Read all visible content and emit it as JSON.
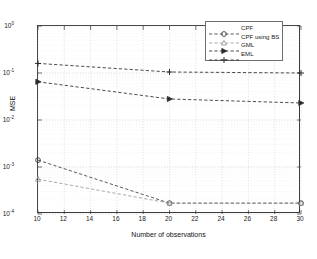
{
  "chart_data": {
    "type": "line",
    "title": "",
    "xlabel": "Number of observations",
    "ylabel": "MSE",
    "xlim": [
      10,
      30
    ],
    "ylim": [
      0.0001,
      1
    ],
    "yscale": "log",
    "grid": true,
    "legend_position": "top-right",
    "xticks": [
      "10",
      "12",
      "14",
      "16",
      "18",
      "20",
      "22",
      "24",
      "26",
      "28",
      "30"
    ],
    "xtick_values": [
      10,
      12,
      14,
      16,
      18,
      20,
      22,
      24,
      26,
      28,
      30
    ],
    "yticks": [
      "10^0",
      "10^-1",
      "10^-2",
      "10^-3",
      "10^-4"
    ],
    "ytick_exponents": [
      "0",
      "-1",
      "-2",
      "-3",
      "-4"
    ],
    "ytick_values": [
      1,
      0.1,
      0.01,
      0.001,
      0.0001
    ],
    "x": [
      10,
      20,
      30
    ],
    "series": [
      {
        "name": "CPF",
        "marker": "circle",
        "linestyle": "dashed",
        "color": "#3c3c3c",
        "values": [
          0.0014,
          0.00017,
          0.00017
        ]
      },
      {
        "name": "CPF using BS",
        "marker": "triangle-up",
        "linestyle": "dashed",
        "color": "#9a9a9a",
        "values": [
          0.00055,
          0.00017,
          0.00017
        ]
      },
      {
        "name": "GML",
        "marker": "triangle-right",
        "linestyle": "dashed",
        "color": "#2b2b2b",
        "values": [
          0.065,
          0.028,
          0.023
        ]
      },
      {
        "name": "EML",
        "marker": "plus",
        "linestyle": "dashed",
        "color": "#2b2b2b",
        "values": [
          0.16,
          0.105,
          0.1
        ]
      }
    ]
  },
  "legend": {
    "entries": [
      {
        "label": "CPF"
      },
      {
        "label": "CPF using BS"
      },
      {
        "label": "GML"
      },
      {
        "label": "EML"
      }
    ]
  }
}
